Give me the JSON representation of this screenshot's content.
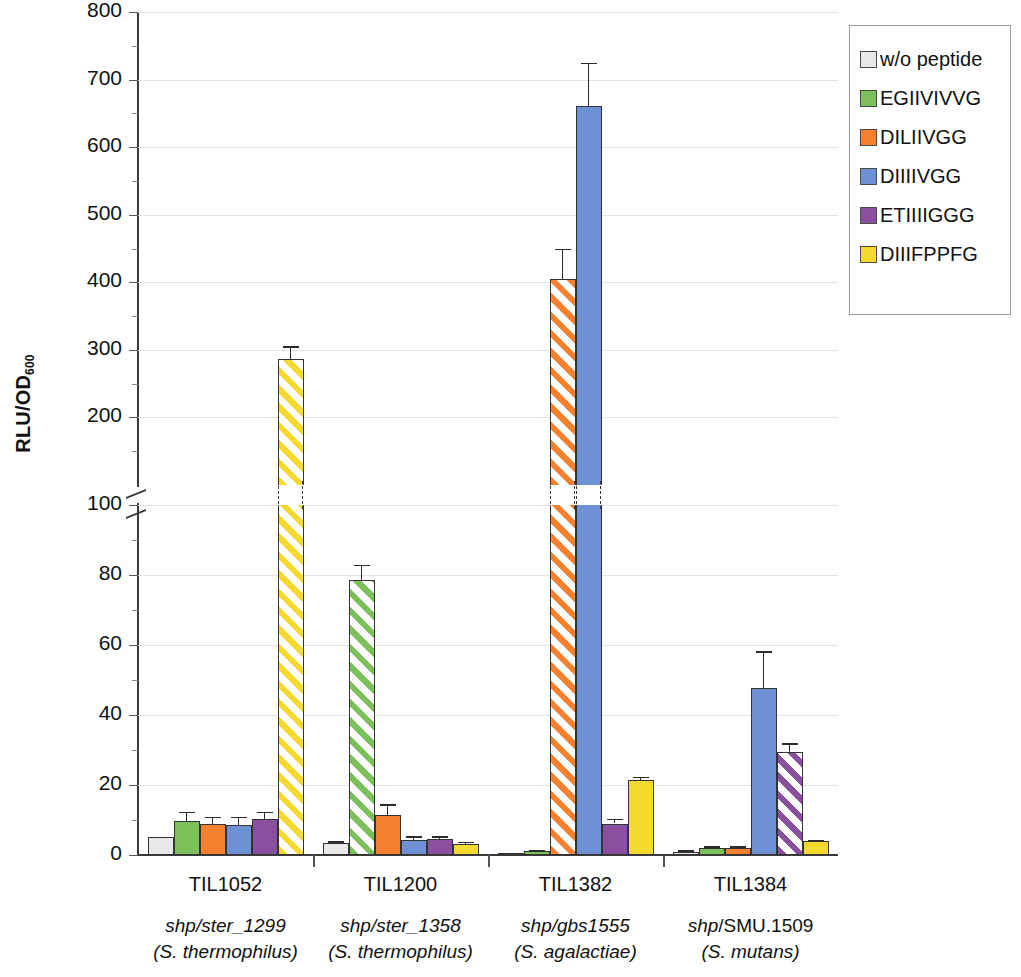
{
  "chart_data": {
    "type": "bar",
    "title": "",
    "xlabel": "",
    "ylabel": "RLU/OD600",
    "ylabel_main": "RLU/OD",
    "ylabel_sub": "600",
    "broken_axis": true,
    "axis_lower": {
      "min": 0,
      "max": 100,
      "ticks": [
        0,
        20,
        40,
        60,
        80,
        100
      ],
      "minor_step": 10
    },
    "axis_upper": {
      "min": 100,
      "max": 800,
      "ticks": [
        100,
        200,
        300,
        400,
        500,
        600,
        700,
        800
      ],
      "minor_step": 50
    },
    "ylim": [
      0,
      800
    ],
    "grid": true,
    "legend_position": "top-right",
    "categories": [
      "TIL1052",
      "TIL1200",
      "TIL1382",
      "TIL1384"
    ],
    "category_sublabels": [
      {
        "gene": "shp/ster_1299",
        "species": "(S. thermophilus)"
      },
      {
        "gene": "shp/ster_1358",
        "species": "(S. thermophilus)"
      },
      {
        "gene": "shp/gbs1555",
        "species": "(S. agalactiae)"
      },
      {
        "gene": "shp/SMU.1509",
        "species": "(S. mutans)"
      }
    ],
    "series": [
      {
        "name": "w/o peptide",
        "color": "#e8e8e8",
        "values": [
          5.2,
          3.3,
          0.5,
          1.0
        ],
        "errors": [
          0.0,
          0.6,
          0.0,
          0.4
        ],
        "hatched": [
          false,
          false,
          false,
          false
        ]
      },
      {
        "name": "EGIIVIVVG",
        "color": "#7cc05c",
        "values": [
          9.7,
          78.5,
          1.2,
          2.0
        ],
        "errors": [
          2.7,
          4.5,
          0.3,
          0.5
        ],
        "hatched": [
          false,
          true,
          false,
          false
        ]
      },
      {
        "name": "DILIIVGG",
        "color": "#f5812f",
        "values": [
          8.8,
          11.5,
          405.0,
          2.1
        ],
        "errors": [
          2.2,
          3.0,
          45.0,
          0.4
        ],
        "hatched": [
          false,
          false,
          true,
          false
        ]
      },
      {
        "name": "DIIIIVGG",
        "color": "#7090d4",
        "values": [
          8.7,
          4.3,
          661.0,
          47.8
        ],
        "errors": [
          2.3,
          1.0,
          64.0,
          10.5
        ],
        "hatched": [
          false,
          false,
          false,
          false
        ]
      },
      {
        "name": "ETIIIIGGG",
        "color": "#8b4fa0",
        "values": [
          10.2,
          4.6,
          9.0,
          29.4
        ],
        "errors": [
          2.2,
          0.8,
          1.4,
          2.6
        ],
        "hatched": [
          false,
          false,
          false,
          true
        ]
      },
      {
        "name": "DIIIFPPFG",
        "color": "#f5d830",
        "values": [
          286.0,
          3.2,
          21.4,
          3.9
        ],
        "errors": [
          20.0,
          0.6,
          1.0,
          0.5
        ],
        "hatched": [
          true,
          false,
          false,
          false
        ]
      }
    ]
  },
  "legend": {
    "items": [
      {
        "label": "w/o peptide",
        "color": "#e8e8e8"
      },
      {
        "label": "EGIIVIVVG",
        "color": "#7cc05c"
      },
      {
        "label": "DILIIVGG",
        "color": "#f5812f"
      },
      {
        "label": "DIIIIVGG",
        "color": "#7090d4"
      },
      {
        "label": "ETIIIIGGG",
        "color": "#8b4fa0"
      },
      {
        "label": "DIIIFPPFG",
        "color": "#f5d830"
      }
    ]
  }
}
